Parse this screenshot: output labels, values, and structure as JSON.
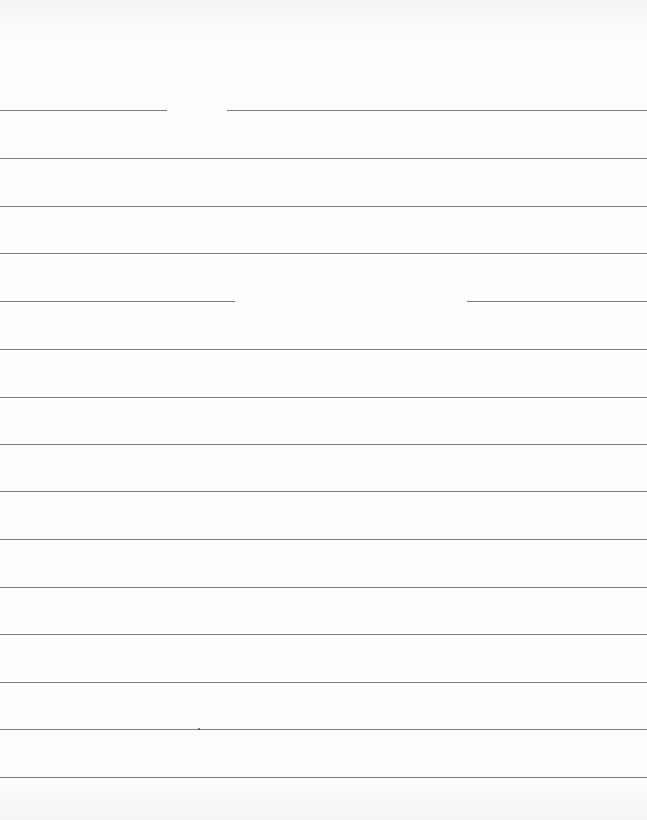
{
  "page": {
    "type": "lined-paper",
    "background_color": "#fdfdfc",
    "line_color": "#7d7d7d",
    "rules": [
      {
        "y": 110,
        "segments": [
          [
            0,
            167
          ],
          [
            227,
            647
          ]
        ]
      },
      {
        "y": 158,
        "segments": [
          [
            0,
            647
          ]
        ]
      },
      {
        "y": 206,
        "segments": [
          [
            0,
            647
          ]
        ]
      },
      {
        "y": 253,
        "segments": [
          [
            0,
            647
          ]
        ]
      },
      {
        "y": 301,
        "segments": [
          [
            0,
            235
          ],
          [
            467,
            647
          ]
        ]
      },
      {
        "y": 349,
        "segments": [
          [
            0,
            647
          ]
        ]
      },
      {
        "y": 397,
        "segments": [
          [
            0,
            647
          ]
        ]
      },
      {
        "y": 444,
        "segments": [
          [
            0,
            647
          ]
        ]
      },
      {
        "y": 491,
        "segments": [
          [
            0,
            647
          ]
        ]
      },
      {
        "y": 539,
        "segments": [
          [
            0,
            647
          ]
        ]
      },
      {
        "y": 587,
        "segments": [
          [
            0,
            647
          ]
        ]
      },
      {
        "y": 634,
        "segments": [
          [
            0,
            647
          ]
        ]
      },
      {
        "y": 682,
        "segments": [
          [
            0,
            647
          ]
        ]
      },
      {
        "y": 729,
        "segments": [
          [
            0,
            647
          ]
        ]
      },
      {
        "y": 777,
        "segments": [
          [
            0,
            647
          ]
        ]
      }
    ],
    "marks": [
      {
        "x": 198,
        "y": 728
      }
    ]
  }
}
